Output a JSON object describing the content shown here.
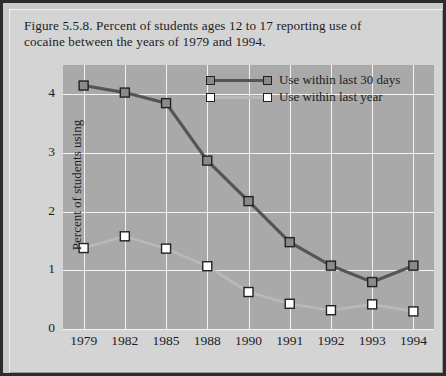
{
  "caption": {
    "line1": "Figure 5.5.8. Percent of students ages 12 to 17 reporting use of",
    "line2": "cocaine between the years of 1979 and 1994."
  },
  "colors": {
    "series_dark": "#555555",
    "series_dark_marker_fill": "#8a8a8a",
    "series_light": "#b9b9b9",
    "series_light_marker_fill": "#ffffff",
    "marker_outline": "#222222",
    "plot_background": "#a9a9a9",
    "gridline": "#f2f2f2",
    "card_background": "#d4d4d4",
    "page_border": "#2b2b2b",
    "text": "#1d1d1d"
  },
  "chart_data": {
    "type": "line",
    "title": "Figure 5.5.8. Percent of students ages 12 to 17 reporting use of cocaine between the years of 1979 and 1994.",
    "xlabel": "",
    "ylabel": "Percent of students using",
    "categories": [
      "1979",
      "1982",
      "1985",
      "1988",
      "1990",
      "1991",
      "1992",
      "1993",
      "1994"
    ],
    "ylim": [
      0,
      4.5
    ],
    "yticks": [
      "0",
      "1",
      "2",
      "3",
      "4"
    ],
    "ytick_values": [
      0,
      1,
      2,
      3,
      4
    ],
    "grid": true,
    "legend_position": "top-center",
    "series": [
      {
        "name": "Use within last 30 days",
        "values": [
          4.15,
          4.03,
          3.85,
          2.87,
          2.18,
          1.48,
          1.08,
          0.8,
          1.08
        ]
      },
      {
        "name": "Use within last year",
        "values": [
          1.38,
          1.58,
          1.37,
          1.07,
          0.63,
          0.43,
          0.32,
          0.42,
          0.3
        ]
      }
    ]
  }
}
